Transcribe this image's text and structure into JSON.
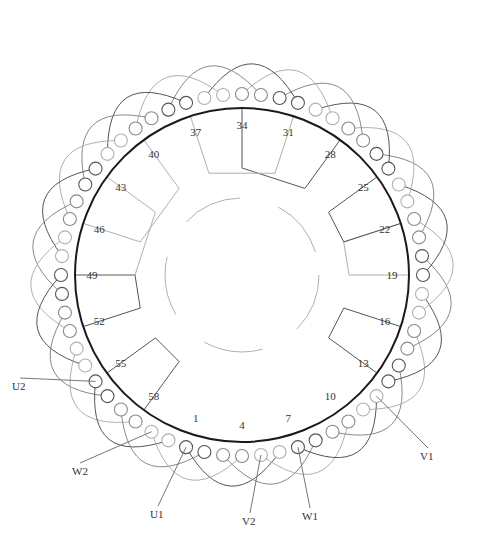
{
  "diagram": {
    "center": [
      242,
      275
    ],
    "stator_radius": 167,
    "slots": 60,
    "slot_labels": [
      "1",
      "4",
      "7",
      "10",
      "13",
      "16",
      "19",
      "22",
      "25",
      "28",
      "31",
      "34",
      "37",
      "40",
      "43",
      "46",
      "49",
      "52",
      "55",
      "58"
    ],
    "terminals": [
      {
        "id": "U1",
        "label": "U1",
        "slot": 1,
        "pos": [
          150,
          518
        ]
      },
      {
        "id": "V2",
        "label": "V2",
        "slot": 5,
        "pos": [
          242,
          525
        ]
      },
      {
        "id": "W1",
        "label": "W1",
        "slot": 7,
        "pos": [
          302,
          520
        ]
      },
      {
        "id": "V1",
        "label": "V1",
        "slot": 12,
        "pos": [
          420,
          460
        ]
      },
      {
        "id": "W2",
        "label": "W2",
        "slot": 59,
        "pos": [
          72,
          475
        ]
      },
      {
        "id": "U2",
        "label": "U2",
        "slot": 55,
        "pos": [
          12,
          390
        ]
      }
    ],
    "colors": {
      "stator": "#1a1a1a",
      "phase_dark": "#555555",
      "phase_mid": "#888888",
      "phase_light": "#b0b0b0"
    }
  }
}
